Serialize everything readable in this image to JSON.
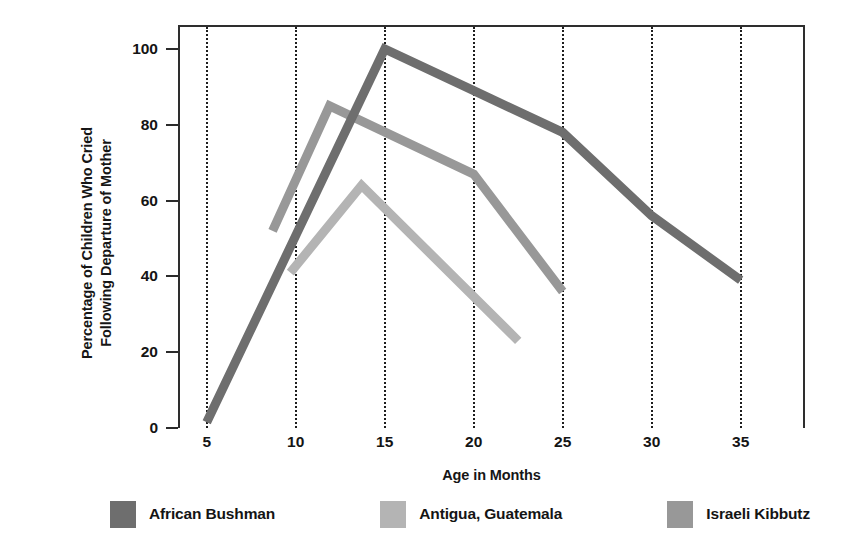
{
  "chart_data": {
    "type": "line",
    "title": "",
    "xlabel": "Age in Months",
    "ylabel": "Percentage of Children Who Cried Following Departure of Mother",
    "ylabel_lines": [
      "Percentage of Children Who Cried",
      "Following Departure of Mother"
    ],
    "xlim": [
      3.5,
      38.5
    ],
    "ylim": [
      0,
      105.8
    ],
    "xticks": [
      5,
      10,
      15,
      20,
      25,
      30,
      35
    ],
    "xtick_labels": [
      "5",
      "10",
      "15",
      "20",
      "25",
      "30",
      "35"
    ],
    "yticks": [
      0,
      20,
      40,
      60,
      80,
      100
    ],
    "ytick_labels": [
      "0",
      "20",
      "40",
      "60",
      "80",
      "100"
    ],
    "grid": "vertical-dotted",
    "legend_position": "below",
    "series": [
      {
        "name": "African Bushman",
        "color": "#6e6e6e",
        "x": [
          5,
          15,
          20,
          25,
          30,
          35
        ],
        "y": [
          1.5,
          100,
          89,
          78,
          56,
          39
        ]
      },
      {
        "name": "Antigua, Guatemala",
        "color": "#b4b4b4",
        "x": [
          9.7,
          13.7,
          22.5
        ],
        "y": [
          41,
          64,
          23
        ]
      },
      {
        "name": "Israeli Kibbutz",
        "color": "#989898",
        "x": [
          8.7,
          11.9,
          20,
          25
        ],
        "y": [
          52,
          85,
          67,
          36
        ]
      }
    ]
  },
  "legend": {
    "items": [
      {
        "label": "African Bushman",
        "color": "#6e6e6e",
        "swatch": "legend-swatch-african-bushman"
      },
      {
        "label": "Antigua, Guatemala",
        "color": "#b4b4b4",
        "swatch": "legend-swatch-antigua-guatemala"
      },
      {
        "label": "Israeli Kibbutz",
        "color": "#989898",
        "swatch": "legend-swatch-israeli-kibbutz"
      }
    ]
  },
  "axes": {
    "x_title": "Age in Months",
    "y_title_line1": "Percentage of Children Who Cried",
    "y_title_line2": "Following Departure of Mother"
  },
  "colors": {
    "african_bushman": "#6e6e6e",
    "antigua_guatemala": "#b4b4b4",
    "israeli_kibbutz": "#989898",
    "axis": "#2e2e2e",
    "text": "#141414",
    "background": "#ffffff"
  }
}
